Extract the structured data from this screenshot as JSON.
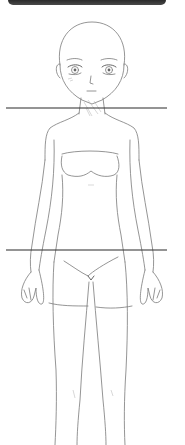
{
  "figure": {
    "stroke_color": "#7a7a7a"
  },
  "top_bar": {
    "color": "#333333"
  },
  "guide_lines": [
    {
      "name": "shoulder-line",
      "y": 108,
      "x1": 6,
      "x2": 167,
      "color": "#2b2b2b"
    },
    {
      "name": "hip-line",
      "y": 250,
      "x1": 6,
      "x2": 167,
      "color": "#2b2b2b"
    }
  ]
}
